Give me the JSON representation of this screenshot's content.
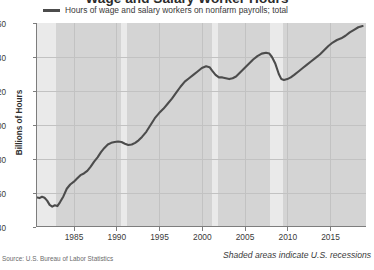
{
  "chart_data": {
    "type": "line",
    "title": "Wage and Salary Worker Hours",
    "xlabel": "",
    "ylabel": "Billions of Hours",
    "ylim": [
      140,
      260
    ],
    "xlim": [
      1980.6,
      2019.2
    ],
    "yticks": [
      140,
      160,
      180,
      200,
      220,
      240,
      260
    ],
    "xticks": [
      1985,
      1990,
      1995,
      2000,
      2005,
      2010,
      2015
    ],
    "grid": true,
    "legend_position": "top-left",
    "series": [
      {
        "name": "Hours of wage and salary workers on nonfarm payrolls; total",
        "color": "#4c4c4c",
        "x": [
          1980.6,
          1981.0,
          1981.3,
          1981.6,
          1981.9,
          1982.2,
          1982.5,
          1982.8,
          1983.1,
          1983.4,
          1983.8,
          1984.2,
          1984.6,
          1985.0,
          1985.4,
          1985.8,
          1986.2,
          1986.6,
          1987.0,
          1987.4,
          1987.8,
          1988.2,
          1988.6,
          1989.0,
          1989.4,
          1989.8,
          1990.2,
          1990.6,
          1991.0,
          1991.4,
          1991.8,
          1992.2,
          1992.6,
          1993.0,
          1993.5,
          1994.0,
          1994.5,
          1995.0,
          1995.5,
          1996.0,
          1996.5,
          1997.0,
          1997.5,
          1998.0,
          1998.5,
          1999.0,
          1999.5,
          2000.0,
          2000.5,
          2000.9,
          2001.2,
          2001.6,
          2002.0,
          2002.4,
          2002.8,
          2003.2,
          2003.6,
          2004.0,
          2004.5,
          2005.0,
          2005.5,
          2006.0,
          2006.5,
          2007.0,
          2007.5,
          2007.9,
          2008.2,
          2008.6,
          2009.0,
          2009.3,
          2009.6,
          2010.0,
          2010.4,
          2010.8,
          2011.3,
          2011.8,
          2012.3,
          2012.8,
          2013.3,
          2013.8,
          2014.3,
          2014.8,
          2015.3,
          2015.8,
          2016.3,
          2016.8,
          2017.3,
          2017.8,
          2018.3,
          2018.8
        ],
        "y": [
          157.5,
          157.0,
          157.8,
          157.2,
          155.5,
          153.0,
          152.0,
          152.8,
          152.3,
          154.5,
          158.0,
          162.5,
          165.0,
          166.5,
          168.5,
          170.5,
          171.5,
          173.0,
          175.5,
          178.5,
          181.0,
          184.0,
          186.5,
          188.5,
          189.5,
          190.0,
          190.3,
          190.0,
          189.0,
          188.2,
          188.5,
          189.5,
          191.0,
          193.0,
          196.0,
          200.0,
          204.0,
          207.0,
          209.5,
          212.5,
          215.5,
          219.0,
          222.5,
          225.5,
          227.5,
          229.5,
          231.5,
          233.5,
          234.5,
          234.0,
          232.0,
          229.5,
          228.0,
          228.0,
          227.5,
          227.0,
          227.5,
          228.5,
          231.0,
          233.5,
          236.0,
          238.5,
          240.5,
          242.0,
          242.5,
          242.0,
          240.0,
          236.0,
          230.0,
          227.0,
          226.5,
          227.0,
          228.0,
          229.5,
          231.5,
          233.5,
          235.5,
          237.5,
          239.5,
          241.5,
          244.0,
          246.5,
          248.5,
          250.0,
          251.0,
          252.5,
          254.5,
          256.0,
          257.5,
          258.2
        ]
      }
    ],
    "recessions": [
      {
        "start": 1980.6,
        "end": 1982.9,
        "label": "1981-82 recession"
      },
      {
        "start": 1990.5,
        "end": 1991.2,
        "label": "1990-91 recession"
      },
      {
        "start": 2001.2,
        "end": 2001.9,
        "label": "2001 recession"
      },
      {
        "start": 2007.9,
        "end": 2009.5,
        "label": "2007-09 recession"
      }
    ],
    "shaded_band_color": "#eaeaea",
    "plot_background_color": "#d4d4d4",
    "annotations": {
      "source": "Source: U.S. Bureau of Labor Statistics",
      "recession_note": "Shaded areas indicate U.S. recessions"
    }
  }
}
